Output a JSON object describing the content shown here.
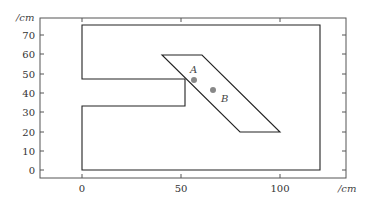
{
  "figure": {
    "x_unit": "/cm",
    "y_unit": "/cm",
    "x_ticks": [
      "0",
      "50",
      "100"
    ],
    "y_ticks": [
      "0",
      "10",
      "20",
      "30",
      "40",
      "50",
      "60",
      "70"
    ],
    "point_a_label": "A",
    "point_b_label": "B",
    "colors": {
      "outline": "#222222",
      "frame": "#555555",
      "point": "#888888"
    }
  },
  "shapes": {
    "outer_region": [
      [
        0,
        74
      ],
      [
        120,
        74
      ],
      [
        120,
        0
      ],
      [
        0,
        0
      ],
      [
        0,
        33
      ],
      [
        52,
        33
      ],
      [
        52,
        47
      ],
      [
        0,
        47
      ]
    ],
    "parallelogram": [
      [
        40,
        60
      ],
      [
        61,
        60
      ],
      [
        100,
        19
      ],
      [
        80,
        19
      ]
    ],
    "point_a": [
      57,
      47
    ],
    "point_b": [
      66,
      42
    ]
  }
}
